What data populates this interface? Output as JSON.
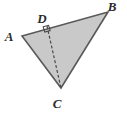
{
  "figure": {
    "background_color": "#ffffff",
    "fill_color": "#c9c9c9",
    "stroke_color": "#595959",
    "dash_color": "#4a4a4a",
    "label_color": "#2b2b2b",
    "triangle": {
      "name": "triangle-abc",
      "points": "22,36 108,12 61,88",
      "vertices": [
        {
          "id": "A",
          "x": 22,
          "y": 36
        },
        {
          "id": "B",
          "x": 108,
          "y": 12
        },
        {
          "id": "C",
          "x": 61,
          "y": 88
        }
      ]
    },
    "altitude": {
      "name": "altitude-cd",
      "from": "D",
      "to": "C",
      "x1": 47,
      "y1": 26,
      "x2": 61,
      "y2": 88,
      "style": "dashed",
      "dash_pattern": "3,2"
    },
    "foot_point": {
      "id": "D",
      "x": 47,
      "y": 26,
      "on_segment": "AB"
    },
    "right_angle_marker": {
      "name": "right-angle-marker-d",
      "points": "43.2,26.8 48.6,25.3 50.2,30.6 44.8,32.1",
      "size": 6
    },
    "labels": [
      {
        "id": "label-a",
        "text": "A",
        "x": 9,
        "y": 41
      },
      {
        "id": "label-b",
        "text": "B",
        "x": 112,
        "y": 11
      },
      {
        "id": "label-c",
        "text": "C",
        "x": 57,
        "y": 108
      },
      {
        "id": "label-d",
        "text": "D",
        "x": 42,
        "y": 23
      }
    ]
  }
}
